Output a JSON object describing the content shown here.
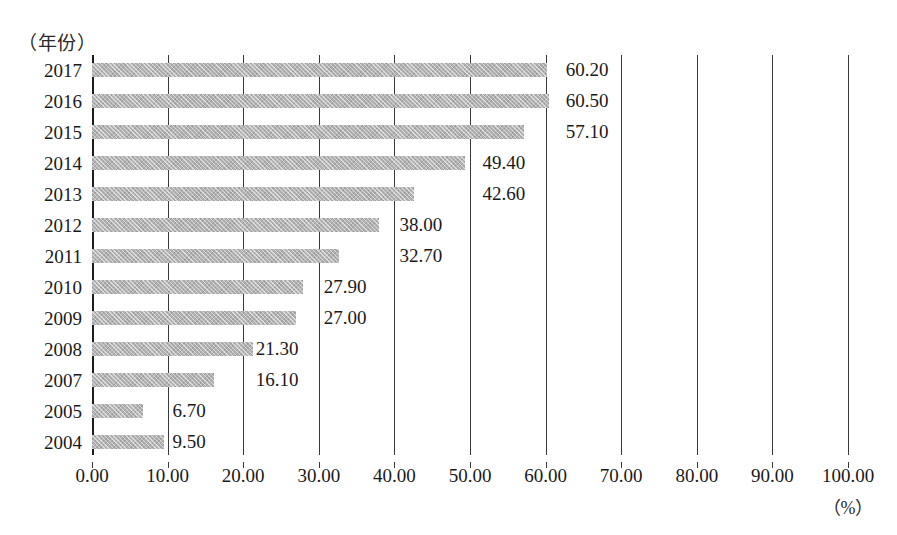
{
  "chart_data": {
    "type": "bar",
    "orientation": "horizontal",
    "title": "",
    "subtitle": "",
    "xlabel": "（%）",
    "ylabel": "（年份）",
    "categories": [
      "2017",
      "2016",
      "2015",
      "2014",
      "2013",
      "2012",
      "2011",
      "2010",
      "2009",
      "2008",
      "2007",
      "2005",
      "2004"
    ],
    "values": [
      60.2,
      60.5,
      57.1,
      49.4,
      42.6,
      38.0,
      32.7,
      27.9,
      27.0,
      21.3,
      16.1,
      6.7,
      9.5
    ],
    "value_labels": [
      "60.20",
      "60.50",
      "57.10",
      "49.40",
      "42.60",
      "38.00",
      "32.70",
      "27.90",
      "27.00",
      "21.30",
      "16.10",
      "6.70",
      "9.50"
    ],
    "xlim": [
      0,
      100
    ],
    "ylim": null,
    "xticks": [
      0,
      10,
      20,
      30,
      40,
      50,
      60,
      70,
      80,
      90,
      100
    ],
    "xtick_labels": [
      "0.00",
      "10.00",
      "20.00",
      "30.00",
      "40.00",
      "50.00",
      "60.00",
      "70.00",
      "80.00",
      "90.00",
      "100.00"
    ],
    "grid": "vertical",
    "legend": null,
    "bar_color": "#b3b3b3",
    "axis_color": "#1d1d1d",
    "gridline_color": "#3a3a3a",
    "text_color": "#1a1a1a",
    "label_offsets_percent": [
      62,
      62,
      62,
      51,
      51,
      40,
      40,
      30,
      30,
      21,
      21,
      10,
      10
    ]
  }
}
